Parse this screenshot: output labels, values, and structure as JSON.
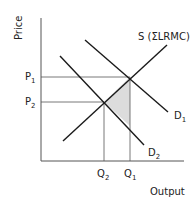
{
  "axes": {
    "y_label": "Price",
    "x_label": "Output"
  },
  "curves": {
    "supply": "S (ΣLRMC)",
    "d1": {
      "base": "D",
      "sub": "1"
    },
    "d2": {
      "base": "D",
      "sub": "2"
    }
  },
  "prices": {
    "p1": {
      "base": "P",
      "sub": "1"
    },
    "p2": {
      "base": "P",
      "sub": "2"
    }
  },
  "quantities": {
    "q1": {
      "base": "Q",
      "sub": "1"
    },
    "q2": {
      "base": "Q",
      "sub": "2"
    }
  },
  "colors": {
    "line": "#1a1a1a",
    "guide": "#555555",
    "shade": "#d9d9d9"
  }
}
